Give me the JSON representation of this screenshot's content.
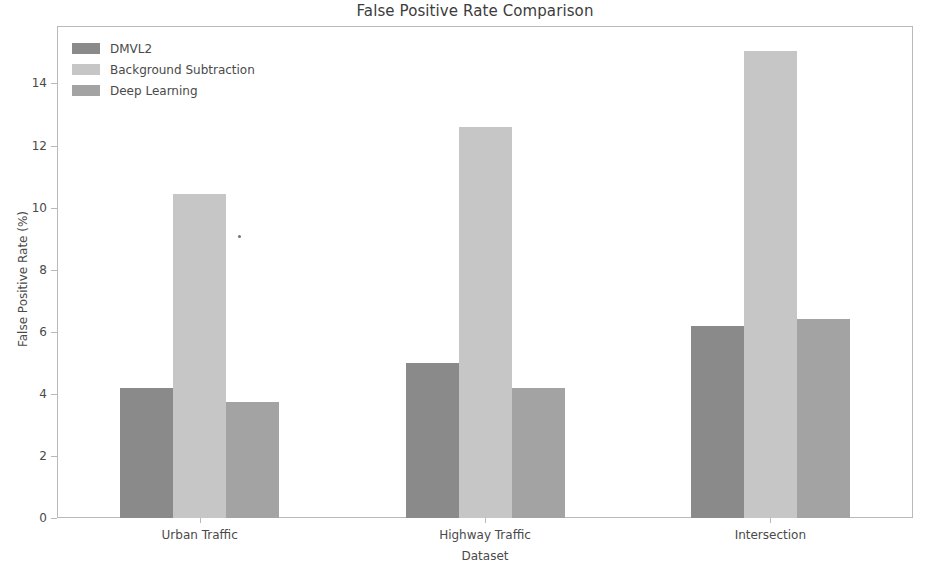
{
  "chart_data": {
    "type": "bar",
    "title": "False Positive Rate Comparison",
    "xlabel": "Dataset",
    "ylabel": "False Positive Rate (%)",
    "categories": [
      "Urban Traffic",
      "Highway Traffic",
      "Intersection"
    ],
    "series": [
      {
        "name": "DMVL2",
        "values": [
          4.2,
          5.0,
          6.2
        ],
        "color": "#8a8a8a"
      },
      {
        "name": "Background Subtraction",
        "values": [
          10.45,
          12.6,
          15.05
        ],
        "color": "#c6c6c6"
      },
      {
        "name": "Deep Learning",
        "values": [
          3.75,
          4.2,
          6.4
        ],
        "color": "#a3a3a3"
      }
    ],
    "ylim": [
      0,
      15.85
    ],
    "yticks": [
      0,
      2,
      4,
      6,
      8,
      10,
      12,
      14
    ],
    "ytick_labels": [
      "0",
      "2",
      "4",
      "6",
      "8",
      "10",
      "12",
      "14"
    ],
    "grid": false,
    "legend_position": "upper left",
    "frame_color": "#b9b9b9",
    "background": "#ffffff"
  }
}
